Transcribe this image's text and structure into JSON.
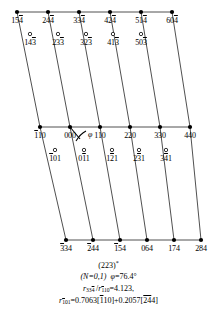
{
  "figure": {
    "kind": "crystallographic-reciprocal-lattice-net",
    "colors": {
      "ink": "#000000",
      "background": "#ffffff",
      "line": "#3a3a3a"
    },
    "angle_symbol": "φ",
    "rows": [
      {
        "name": "top-row",
        "y": 12,
        "marker": "filled",
        "points": [
          {
            "x": 17,
            "pre": "15",
            "over": "4",
            "post": ""
          },
          {
            "x": 48,
            "pre": "24",
            "over": "4",
            "post": ""
          },
          {
            "x": 79,
            "pre": "33",
            "over": "4",
            "post": ""
          },
          {
            "x": 110,
            "pre": "42",
            "over": "4",
            "post": ""
          },
          {
            "x": 141,
            "pre": "51",
            "over": "4",
            "post": ""
          },
          {
            "x": 172,
            "pre": "60",
            "over": "4",
            "post": ""
          }
        ]
      },
      {
        "name": "top-open-row",
        "y": 34,
        "marker": "open",
        "points": [
          {
            "x": 30,
            "pre": "14",
            "over": "3",
            "post": ""
          },
          {
            "x": 58,
            "pre": "23",
            "over": "3",
            "post": ""
          },
          {
            "x": 86,
            "pre": "32",
            "over": "3",
            "post": ""
          },
          {
            "x": 113,
            "pre": "41",
            "over": "3",
            "post": ""
          },
          {
            "x": 141,
            "pre": "50",
            "over": "3",
            "post": ""
          }
        ]
      },
      {
        "name": "middle-row",
        "y": 127,
        "marker": "filled",
        "points": [
          {
            "x": 40,
            "pre": "",
            "over": "1",
            "post": "10"
          },
          {
            "x": 70,
            "pre": "000",
            "over": "",
            "post": ""
          },
          {
            "x": 100,
            "pre": "110",
            "over": "",
            "post": ""
          },
          {
            "x": 130,
            "pre": "220",
            "over": "",
            "post": ""
          },
          {
            "x": 160,
            "pre": "330",
            "over": "",
            "post": ""
          },
          {
            "x": 190,
            "pre": "440",
            "over": "",
            "post": ""
          }
        ]
      },
      {
        "name": "middle-open-row",
        "y": 150,
        "marker": "open",
        "points": [
          {
            "x": 55,
            "pre": "",
            "over": "1",
            "post": "01"
          },
          {
            "x": 84,
            "pre": "0",
            "over": "1",
            "post": "1"
          },
          {
            "x": 112,
            "pre": "1",
            "over": "2",
            "post": "1"
          },
          {
            "x": 139,
            "pre": "2",
            "over": "3",
            "post": "1"
          },
          {
            "x": 166,
            "pre": "3",
            "over": "4",
            "post": "1"
          }
        ]
      },
      {
        "name": "bottom-row",
        "y": 240,
        "marker": "filled",
        "points": [
          {
            "x": 66,
            "pre": "",
            "over": "3",
            "post": "34"
          },
          {
            "x": 93,
            "pre": "",
            "over": "2",
            "post": "44"
          },
          {
            "x": 120,
            "pre": "",
            "over": "1",
            "post": "54"
          },
          {
            "x": 147,
            "pre": "064",
            "over": "",
            "post": ""
          },
          {
            "x": 174,
            "pre": "174",
            "over": "",
            "post": ""
          },
          {
            "x": 201,
            "pre": "284",
            "over": "",
            "post": ""
          }
        ]
      }
    ],
    "connector_lines": [
      {
        "x1": 17,
        "y1": 12,
        "x2": 40,
        "y2": 127
      },
      {
        "x1": 48,
        "y1": 12,
        "x2": 70,
        "y2": 127
      },
      {
        "x1": 79,
        "y1": 12,
        "x2": 100,
        "y2": 127
      },
      {
        "x1": 110,
        "y1": 12,
        "x2": 130,
        "y2": 127
      },
      {
        "x1": 141,
        "y1": 12,
        "x2": 160,
        "y2": 127
      },
      {
        "x1": 172,
        "y1": 12,
        "x2": 190,
        "y2": 127
      },
      {
        "x1": 40,
        "y1": 127,
        "x2": 66,
        "y2": 240
      },
      {
        "x1": 70,
        "y1": 127,
        "x2": 93,
        "y2": 240
      },
      {
        "x1": 100,
        "y1": 127,
        "x2": 120,
        "y2": 240
      },
      {
        "x1": 130,
        "y1": 127,
        "x2": 147,
        "y2": 240
      },
      {
        "x1": 160,
        "y1": 127,
        "x2": 174,
        "y2": 240
      },
      {
        "x1": 190,
        "y1": 127,
        "x2": 201,
        "y2": 240
      }
    ],
    "angle_marker": {
      "x": 79,
      "y": 138,
      "label": "φ"
    }
  },
  "caption": {
    "line1_plane": "(223)",
    "line1_star": "*",
    "line2_n": "(N=0,1)",
    "line2_phi_symbol": "φ",
    "line2_phi_value": "=76.4°",
    "line3_r_num_pre": "33",
    "line3_r_num_over": "4",
    "line3_r_den_over": "1",
    "line3_r_den_post": "10",
    "line3_value": "=4.123,",
    "line4_r_sub_over": "1",
    "line4_r_sub_post": "01",
    "line4_body_a": "=0.7063[",
    "line4_b1_over": "1",
    "line4_b1_post": "10",
    "line4_body_b": "]+0.2057[",
    "line4_b2_over": "24",
    "line4_b2_post": "4",
    "line4_body_c": "]",
    "r_symbol": "r"
  }
}
